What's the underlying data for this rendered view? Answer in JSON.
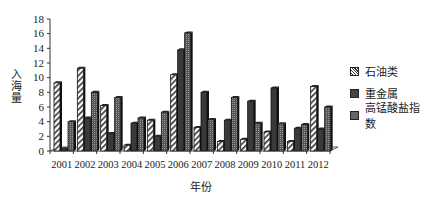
{
  "chart_data": {
    "type": "bar",
    "title": "",
    "xlabel": "年份",
    "ylabel": "入海量",
    "ylim": [
      0,
      18
    ],
    "yticks": [
      0,
      2,
      4,
      6,
      8,
      10,
      12,
      14,
      16,
      18
    ],
    "grid": false,
    "legend_position": "right",
    "style": "3d-clustered-bar",
    "categories": [
      "2001",
      "2002",
      "2003",
      "2004",
      "2005",
      "2006",
      "2007",
      "2008",
      "2009",
      "2010",
      "2011",
      "2012"
    ],
    "series": [
      {
        "name": "石油类",
        "pattern": "diagonal-hatch",
        "values": [
          9.3,
          11.3,
          6.2,
          0.8,
          4.2,
          10.4,
          3.2,
          1.3,
          1.6,
          2.6,
          1.3,
          8.8
        ]
      },
      {
        "name": "重金属",
        "pattern": "dark-solid",
        "values": [
          0.3,
          4.5,
          2.4,
          3.8,
          2.0,
          13.8,
          8.0,
          4.2,
          6.8,
          8.6,
          3.1,
          3.0
        ]
      },
      {
        "name": "高锰酸盐指数",
        "pattern": "dark-dotted",
        "values": [
          4.0,
          8.0,
          7.3,
          4.5,
          5.3,
          16.1,
          4.3,
          7.3,
          3.8,
          3.7,
          3.6,
          6.0
        ]
      }
    ]
  },
  "axis": {
    "ylabel": "入海量",
    "xlabel": "年份"
  },
  "legend": {
    "items": [
      {
        "label": "石油类"
      },
      {
        "label": "重金属"
      },
      {
        "label": "高锰酸盐指数"
      }
    ]
  }
}
